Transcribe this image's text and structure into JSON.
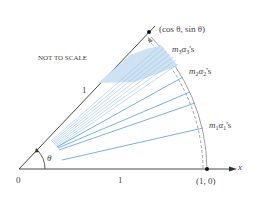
{
  "diagram": {
    "note": "NOT TO SCALE",
    "origin_label": "0",
    "x_tick_label": "1",
    "radius_label": "1",
    "angle_label": "θ",
    "axis_label": "x",
    "point_unit": "(1, 0)",
    "point_angle": "(cos θ, sin θ)",
    "groups": [
      {
        "m": "m",
        "m_sub": "3",
        "a": "α",
        "a_sub": "3",
        "suffix": "'s"
      },
      {
        "m": "m",
        "m_sub": "2",
        "a": "α",
        "a_sub": "2",
        "suffix": "'s"
      },
      {
        "m": "m",
        "m_sub": "1",
        "a": "α",
        "a_sub": "1",
        "suffix": "'s"
      }
    ],
    "colors": {
      "axis": "#333333",
      "rays": "#5b9bd5",
      "shade": "#cfe2f3",
      "arc": "#777777"
    }
  }
}
